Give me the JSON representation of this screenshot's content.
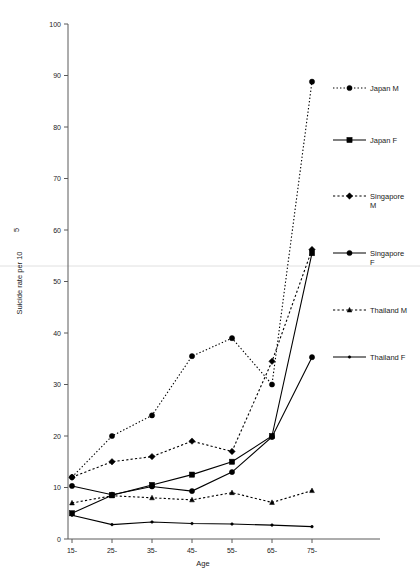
{
  "chart_data": {
    "type": "line",
    "title": "",
    "xlabel": "Age",
    "ylabel": "Suicide rate per 10",
    "ylabel_superscript": "5",
    "categories": [
      "15-",
      "25-",
      "35-",
      "45-",
      "55-",
      "65-",
      "75-"
    ],
    "xlim": [
      0,
      6
    ],
    "ylim": [
      0,
      100
    ],
    "ytick_step": 10,
    "yticks": [
      0,
      10,
      20,
      30,
      40,
      50,
      60,
      70,
      80,
      90,
      100
    ],
    "grid": false,
    "legend_position": "right",
    "series": [
      {
        "name": "Japan M",
        "label": "Japan M",
        "marker": "circle",
        "linestyle": "dotted",
        "color": "#000000",
        "values": [
          12.0,
          20.0,
          24.0,
          35.5,
          39.0,
          30.0,
          88.8
        ]
      },
      {
        "name": "Japan F",
        "label": "Japan F",
        "marker": "square",
        "linestyle": "solid",
        "color": "#000000",
        "values": [
          5.0,
          8.5,
          10.5,
          12.5,
          15.0,
          20.0,
          55.5
        ]
      },
      {
        "name": "Singapore M",
        "label": "Singapore M",
        "label_line1": "Singapore",
        "label_line2": "M",
        "marker": "diamond",
        "linestyle": "dashed",
        "color": "#000000",
        "values": [
          12.0,
          15.0,
          16.0,
          19.0,
          17.0,
          34.5,
          56.2
        ]
      },
      {
        "name": "Singapore F",
        "label": "Singapore F",
        "label_line1": "Singapore",
        "label_line2": "F",
        "marker": "circle",
        "linestyle": "solid",
        "color": "#000000",
        "values": [
          10.3,
          8.6,
          10.2,
          9.3,
          13.0,
          19.8,
          35.3
        ]
      },
      {
        "name": "Thailand M",
        "label": "Thailand M",
        "marker": "triangle",
        "linestyle": "dashed",
        "color": "#000000",
        "values": [
          7.0,
          8.4,
          8.0,
          7.6,
          9.0,
          7.1,
          9.4
        ]
      },
      {
        "name": "Thailand F",
        "label": "Thailand F",
        "marker": "dot",
        "linestyle": "solid",
        "color": "#000000",
        "values": [
          4.6,
          2.8,
          3.3,
          3.0,
          2.9,
          2.7,
          2.4
        ]
      }
    ]
  },
  "legend": {
    "entries": [
      {
        "label": "Japan M"
      },
      {
        "label": "Japan F"
      },
      {
        "label": "Singapore"
      },
      {
        "label": "M"
      },
      {
        "label": "Singapore"
      },
      {
        "label": "F"
      },
      {
        "label": "Thailand M"
      },
      {
        "label": "Thailand F"
      }
    ]
  },
  "axis": {
    "y_title": "Suicide rate per 10",
    "y_title_sup": "5",
    "x_title": "Age",
    "ytick_labels": [
      "0",
      "10",
      "20",
      "30",
      "40",
      "50",
      "60",
      "70",
      "80",
      "90",
      "100"
    ],
    "xtick_labels": [
      "15-",
      "25-",
      "35-",
      "45-",
      "55-",
      "65-",
      "75-"
    ]
  }
}
